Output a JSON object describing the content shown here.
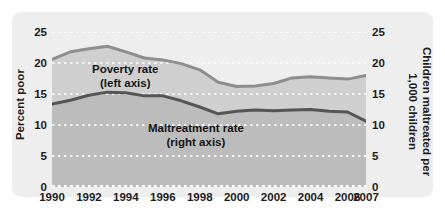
{
  "chart_data": {
    "type": "line",
    "title": "",
    "subtitle": "",
    "xlabel": "",
    "ylabel": "Percent poor",
    "y2label": "Children maltreated per 1,000 children",
    "xlim": [
      1990,
      2007
    ],
    "ylim": [
      0,
      25
    ],
    "y2lim": [
      0,
      25
    ],
    "yticks": [
      0,
      5,
      10,
      15,
      20,
      25
    ],
    "y2ticks": [
      0,
      5,
      10,
      15,
      20,
      25
    ],
    "xticks": [
      1990,
      1992,
      1994,
      1996,
      1998,
      2000,
      2002,
      2004,
      2006,
      2007
    ],
    "xticklabels": [
      "1990",
      "1992",
      "1994",
      "1996",
      "1998",
      "2000",
      "2002",
      "2004",
      "2006",
      "2007"
    ],
    "yticklabels": [
      "0",
      "5",
      "10",
      "15",
      "20",
      "25"
    ],
    "y2ticklabels": [
      "0",
      "5",
      "10",
      "15",
      "20",
      "25"
    ],
    "grid": "horizontal-dotted-white",
    "legend": "in-plot annotations",
    "x": [
      1990,
      1991,
      1992,
      1993,
      1994,
      1995,
      1996,
      1997,
      1998,
      1999,
      2000,
      2001,
      2002,
      2003,
      2004,
      2005,
      2006,
      2007
    ],
    "series": [
      {
        "name": "Poverty rate",
        "axis": "left",
        "units": "percent",
        "color": "#8e8e8e",
        "annotation": "Poverty rate\n(left axis)",
        "values": [
          20.6,
          21.8,
          22.3,
          22.7,
          21.8,
          20.8,
          20.5,
          19.9,
          18.9,
          16.9,
          16.2,
          16.3,
          16.7,
          17.6,
          17.8,
          17.6,
          17.4,
          18.0
        ]
      },
      {
        "name": "Maltreatment rate",
        "axis": "right",
        "units": "per 1,000 children",
        "color": "#555555",
        "annotation": "Maltreatment rate\n(right axis)",
        "values": [
          13.4,
          14.0,
          14.8,
          15.3,
          15.2,
          14.7,
          14.7,
          13.9,
          12.9,
          11.8,
          12.2,
          12.4,
          12.3,
          12.4,
          12.5,
          12.2,
          12.1,
          10.6
        ]
      }
    ]
  },
  "axes": {
    "left_title": "Percent poor",
    "right_title": "Children maltreated per\n1,000 children",
    "right_title_line1": "Children maltreated per",
    "right_title_line2": "1,000 children"
  },
  "annotations": {
    "poverty_line1": "Poverty rate",
    "poverty_line2": "(left axis)",
    "maltreatment_line1": "Maltreatment rate",
    "maltreatment_line2": "(right axis)"
  },
  "colors": {
    "panel_background": "#eeeeee",
    "plot_fill_upper": "#cfcfcf",
    "plot_fill_lower": "#bfbfbf",
    "poverty_line": "#8e8e8e",
    "maltreatment_line": "#555555",
    "gridline": "#ffffff",
    "text": "#1c1c1c"
  }
}
